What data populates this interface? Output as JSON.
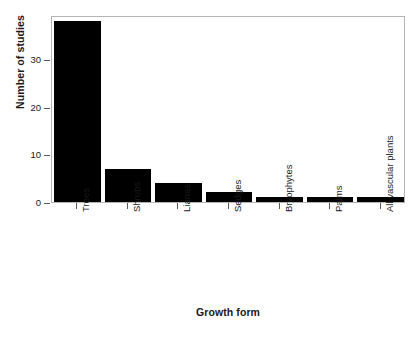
{
  "chart_data": {
    "type": "bar",
    "title": "",
    "xlabel": "Growth form",
    "ylabel": "Number of studies",
    "categories": [
      "Trees",
      "Shrubs",
      "Lianas",
      "Sedges",
      "Bryophytes",
      "Palms",
      "All vascular plants"
    ],
    "values": [
      38,
      7,
      4,
      2,
      1,
      1,
      1
    ],
    "yticks": [
      0,
      10,
      20,
      30
    ],
    "ytick_labels": [
      "0",
      "10",
      "20",
      "30"
    ],
    "ylim": [
      0,
      39.2
    ],
    "grid": false,
    "legend": null,
    "bar_color": "#000000",
    "panel_border_color": "#b4b4b4",
    "background_color": "#ffffff",
    "xtick_label_rotation": 90
  }
}
